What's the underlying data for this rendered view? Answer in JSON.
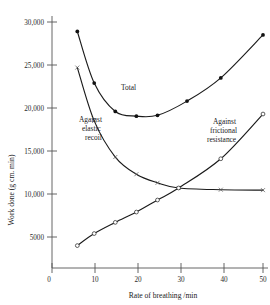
{
  "chart_data": {
    "type": "line",
    "title": "",
    "xlabel": "Rate of breathing /min",
    "ylabel": "Work done   (g cm. min)",
    "xlim": [
      0,
      52
    ],
    "ylim": [
      0,
      31500
    ],
    "xticks": [
      0,
      10,
      20,
      30,
      40,
      50
    ],
    "xticklabels": [
      "0",
      "10",
      "20",
      "30",
      "40",
      "50"
    ],
    "yticks": [
      5000,
      10000,
      15000,
      20000,
      25000,
      30000
    ],
    "yticklabels": [
      "5000",
      "10,000",
      "15,000",
      "20,000",
      "25,000",
      "30,000"
    ],
    "grid": false,
    "legend_position": "inline-annotations",
    "series": [
      {
        "name": "Total",
        "marker": "filled-circle",
        "label_text": "Total",
        "x": [
          6,
          10,
          15,
          20,
          25,
          32,
          40,
          50
        ],
        "y": [
          28900,
          22900,
          19600,
          19050,
          19150,
          20800,
          23500,
          28500
        ]
      },
      {
        "name": "Against elastic recoil",
        "marker": "cross",
        "label_text": "Against elastic recoil",
        "x": [
          6,
          10,
          15,
          20,
          25,
          30,
          40,
          50
        ],
        "y": [
          24700,
          18500,
          14300,
          12300,
          11300,
          10700,
          10500,
          10450
        ]
      },
      {
        "name": "Against frictional resistance",
        "marker": "open-circle",
        "label_text": "Against frictional resistance",
        "x": [
          6,
          10,
          15,
          20,
          25,
          30,
          40,
          50
        ],
        "y": [
          4000,
          5400,
          6700,
          7900,
          9300,
          10700,
          14100,
          19300
        ]
      }
    ],
    "annotations": [
      {
        "text": "Total",
        "x": 24,
        "y": 21500
      },
      {
        "text": "Against",
        "x": 12.5,
        "y": 15500
      },
      {
        "text": "elastic",
        "x": 12.5,
        "y": 14200
      },
      {
        "text": "recoil",
        "x": 12.5,
        "y": 12900
      },
      {
        "text": "Against",
        "x": 37,
        "y": 15200
      },
      {
        "text": "frictional",
        "x": 37,
        "y": 13900
      },
      {
        "text": "resistance",
        "x": 37,
        "y": 12600
      }
    ],
    "colors": {
      "ink": "#1b1b1b",
      "axis": "#555555",
      "background": "#ffffff"
    }
  }
}
